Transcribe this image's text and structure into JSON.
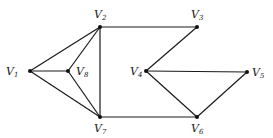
{
  "graph": {
    "type": "undirected",
    "vertices": [
      {
        "id": "v1",
        "label": "V",
        "sub": "1",
        "x": 30,
        "y": 71,
        "lx": 6,
        "ly": 75
      },
      {
        "id": "v2",
        "label": "V",
        "sub": "2",
        "x": 100,
        "y": 27,
        "lx": 94,
        "ly": 18
      },
      {
        "id": "v3",
        "label": "V",
        "sub": "3",
        "x": 197,
        "y": 27,
        "lx": 191,
        "ly": 18
      },
      {
        "id": "v4",
        "label": "V",
        "sub": "4",
        "x": 146,
        "y": 71,
        "lx": 130,
        "ly": 75
      },
      {
        "id": "v5",
        "label": "V",
        "sub": "5",
        "x": 247,
        "y": 72,
        "lx": 252,
        "ly": 76
      },
      {
        "id": "v6",
        "label": "V",
        "sub": "6",
        "x": 197,
        "y": 117,
        "lx": 191,
        "ly": 132
      },
      {
        "id": "v7",
        "label": "V",
        "sub": "7",
        "x": 100,
        "y": 117,
        "lx": 94,
        "ly": 132
      },
      {
        "id": "v8",
        "label": "V",
        "sub": "8",
        "x": 68,
        "y": 71,
        "lx": 76,
        "ly": 75
      }
    ],
    "edges": [
      [
        "v1",
        "v2"
      ],
      [
        "v1",
        "v8"
      ],
      [
        "v1",
        "v7"
      ],
      [
        "v8",
        "v2"
      ],
      [
        "v8",
        "v7"
      ],
      [
        "v2",
        "v7"
      ],
      [
        "v2",
        "v3"
      ],
      [
        "v3",
        "v4"
      ],
      [
        "v4",
        "v5"
      ],
      [
        "v4",
        "v6"
      ],
      [
        "v5",
        "v6"
      ],
      [
        "v7",
        "v6"
      ]
    ]
  }
}
